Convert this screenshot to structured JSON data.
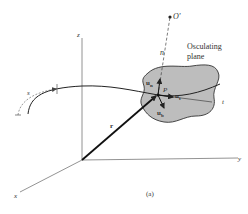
{
  "figure": {
    "caption": "(a)",
    "colors": {
      "background": "#ffffff",
      "line": "#333333",
      "plane_fill": "#bdbdbd",
      "axis": "#777777"
    }
  },
  "axes": {
    "x_label": "x",
    "y_label": "y",
    "z_label": "z"
  },
  "labels": {
    "center_of_curvature": "O'",
    "normal_axis": "n",
    "tangent_axis": "t",
    "point": "P",
    "position_vector": "r",
    "arc_length": "s",
    "plane_title_line1": "Osculating",
    "plane_title_line2": "plane",
    "unit_normal": "u",
    "unit_normal_sub": "n",
    "unit_tangent": "u",
    "unit_tangent_sub": "t",
    "unit_binormal": "u",
    "unit_binormal_sub": "b"
  }
}
